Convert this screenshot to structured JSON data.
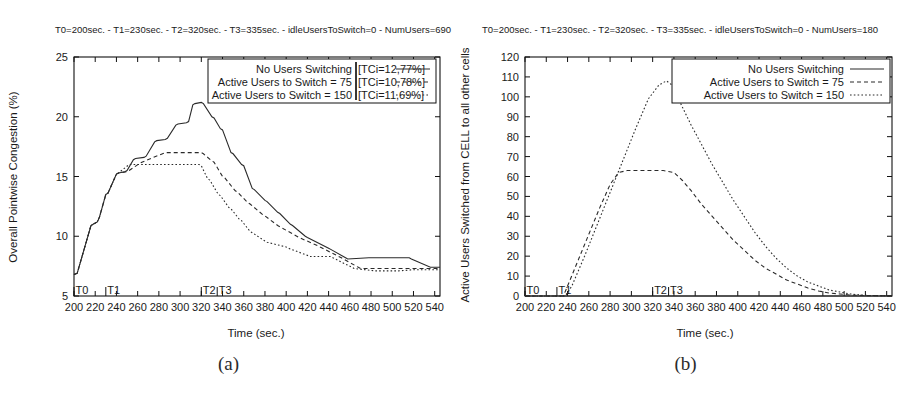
{
  "figure": {
    "captions": [
      "(a)",
      "(b)"
    ]
  },
  "chart_data": [
    {
      "id": "panel-a",
      "type": "line",
      "title": "T0=200sec. - T1=230sec. - T2=320sec. - T3=335sec. - idleUsersToSwitch=0 - NumUsers=690",
      "xlabel": "Time (sec.)",
      "ylabel": "Overall Pointwise Congestion (%)",
      "xlim": [
        200,
        545
      ],
      "ylim": [
        5,
        25
      ],
      "xticks": [
        200,
        220,
        240,
        260,
        280,
        300,
        320,
        340,
        360,
        380,
        400,
        420,
        440,
        460,
        480,
        500,
        520,
        540
      ],
      "yticks": [
        5,
        10,
        15,
        20,
        25
      ],
      "grid": false,
      "legend_position": "top-right",
      "markers": [
        {
          "label": "T0",
          "x": 200
        },
        {
          "label": "T1",
          "x": 230
        },
        {
          "label": "T2",
          "x": 320
        },
        {
          "label": "T3",
          "x": 335
        }
      ],
      "series": [
        {
          "name": "No Users Switching [TCi=12,77%]",
          "label_left": "No Users Switching",
          "label_right": "[TCi=12,77%]",
          "dash": "none",
          "x": [
            200,
            203,
            216,
            218,
            222,
            224,
            230,
            232,
            240,
            242,
            248,
            250,
            256,
            258,
            266,
            268,
            276,
            278,
            286,
            288,
            296,
            298,
            306,
            308,
            312,
            314,
            320,
            322,
            330,
            332,
            338,
            340,
            348,
            350,
            358,
            360,
            368,
            370,
            380,
            382,
            392,
            394,
            404,
            406,
            418,
            420,
            440,
            442,
            456,
            458,
            478,
            480,
            500,
            502,
            516,
            518,
            536,
            545
          ],
          "y": [
            6.8,
            6.9,
            10.9,
            11.0,
            11.2,
            11.6,
            13.5,
            13.6,
            15.2,
            15.3,
            15.4,
            15.5,
            16.4,
            16.5,
            16.6,
            16.7,
            17.9,
            18.0,
            18.1,
            18.2,
            19.3,
            19.4,
            19.5,
            19.6,
            21.0,
            21.1,
            21.2,
            21.1,
            20.0,
            19.9,
            19.0,
            18.9,
            17.0,
            16.9,
            16.0,
            15.9,
            14.0,
            13.9,
            13.0,
            12.9,
            12.0,
            11.9,
            11.0,
            10.9,
            10.0,
            9.9,
            9.0,
            8.9,
            8.2,
            8.1,
            8.2,
            8.2,
            8.2,
            8.2,
            8.2,
            8.1,
            7.4,
            7.4
          ]
        },
        {
          "name": "Active Users to Switch = 75 [TCi=10,78%]",
          "label_left": "Active Users to Switch = 75",
          "label_right": "[TCi=10,78%]",
          "dash": "medium",
          "x": [
            200,
            203,
            216,
            218,
            222,
            224,
            230,
            232,
            240,
            242,
            250,
            252,
            262,
            264,
            286,
            288,
            320,
            322,
            330,
            332,
            340,
            342,
            352,
            354,
            364,
            366,
            378,
            380,
            392,
            394,
            410,
            412,
            430,
            432,
            452,
            454,
            468,
            470,
            500,
            502,
            520,
            545
          ],
          "y": [
            6.8,
            6.9,
            10.9,
            11.0,
            11.2,
            11.6,
            13.5,
            13.6,
            15.2,
            15.3,
            15.4,
            15.5,
            16.1,
            16.2,
            17.0,
            17.0,
            17.0,
            16.9,
            16.3,
            16.2,
            15.0,
            14.9,
            13.8,
            13.7,
            12.8,
            12.7,
            11.8,
            11.7,
            10.9,
            10.8,
            10.0,
            9.9,
            9.2,
            9.1,
            8.2,
            8.1,
            7.4,
            7.3,
            7.3,
            7.3,
            7.3,
            7.3
          ]
        },
        {
          "name": "Active Users to Switch = 150 [TCi=11,69%]",
          "label_left": "Active Users to Switch = 150",
          "label_right": "[TCi=11,69%]",
          "dash": "fine",
          "x": [
            200,
            203,
            216,
            218,
            222,
            224,
            230,
            232,
            240,
            242,
            252,
            254,
            286,
            288,
            318,
            320,
            326,
            328,
            336,
            338,
            346,
            348,
            356,
            358,
            366,
            368,
            380,
            382,
            400,
            402,
            420,
            422,
            442,
            444,
            462,
            464,
            484,
            486,
            504,
            506,
            520,
            545
          ],
          "y": [
            6.8,
            6.9,
            10.9,
            11.0,
            11.2,
            11.6,
            13.5,
            13.6,
            15.2,
            15.3,
            16.0,
            16.0,
            16.0,
            16.0,
            16.0,
            15.9,
            14.8,
            14.7,
            13.5,
            13.4,
            12.4,
            12.3,
            11.4,
            11.3,
            10.4,
            10.3,
            9.6,
            9.5,
            9.1,
            9.0,
            8.4,
            8.3,
            8.3,
            8.2,
            7.4,
            7.3,
            7.1,
            7.1,
            7.1,
            7.1,
            7.2,
            7.2
          ]
        }
      ]
    },
    {
      "id": "panel-b",
      "type": "line",
      "title": "T0=200sec. - T1=230sec. - T2=320sec. - T3=335sec. - idleUsersToSwitch=0 - NumUsers=180",
      "xlabel": "Time (sec.)",
      "ylabel": "Active Users Switched from CELL to all other cells",
      "xlim": [
        200,
        545
      ],
      "ylim": [
        0,
        120
      ],
      "xticks": [
        200,
        220,
        240,
        260,
        280,
        300,
        320,
        340,
        360,
        380,
        400,
        420,
        440,
        460,
        480,
        500,
        520,
        540
      ],
      "yticks": [
        0,
        10,
        20,
        30,
        40,
        50,
        60,
        70,
        80,
        90,
        100,
        110,
        120
      ],
      "grid": false,
      "legend_position": "top-right",
      "markers": [
        {
          "label": "T0",
          "x": 200
        },
        {
          "label": "T1",
          "x": 230
        },
        {
          "label": "T2",
          "x": 320
        },
        {
          "label": "T3",
          "x": 335
        }
      ],
      "series": [
        {
          "name": "No Users Switching",
          "label_left": "No Users Switching",
          "label_right": "",
          "dash": "none",
          "x": [
            200,
            545
          ],
          "y": [
            0,
            0
          ]
        },
        {
          "name": "Active Users to Switch = 75",
          "label_left": "Active Users to Switch = 75",
          "label_right": "",
          "dash": "medium",
          "x": [
            200,
            236,
            240,
            250,
            260,
            270,
            280,
            288,
            296,
            310,
            320,
            330,
            340,
            348,
            356,
            366,
            376,
            386,
            396,
            406,
            416,
            426,
            436,
            446,
            456,
            466,
            476,
            486,
            496,
            506,
            520,
            545
          ],
          "y": [
            0,
            0,
            5,
            18,
            31,
            44,
            56,
            62,
            63,
            63,
            63,
            63,
            62,
            58,
            53,
            46,
            40,
            34,
            28,
            23,
            18,
            14,
            11,
            8,
            6,
            4,
            2.5,
            1.5,
            1,
            0.5,
            0.2,
            0.1
          ]
        },
        {
          "name": "Active Users to Switch = 150",
          "label_left": "Active Users to Switch = 150",
          "label_right": "",
          "dash": "fine",
          "x": [
            200,
            238,
            244,
            256,
            268,
            280,
            292,
            304,
            316,
            326,
            333,
            338,
            346,
            356,
            366,
            376,
            386,
            396,
            406,
            416,
            426,
            436,
            446,
            456,
            466,
            476,
            486,
            496,
            506,
            520,
            545
          ],
          "y": [
            0,
            0,
            5,
            20,
            36,
            52,
            68,
            84,
            99,
            106,
            108,
            106,
            97,
            86,
            76,
            66,
            57,
            48,
            40,
            32,
            25,
            19,
            14,
            10,
            7,
            5,
            3,
            2,
            1,
            0.3,
            0.1
          ]
        }
      ]
    }
  ]
}
